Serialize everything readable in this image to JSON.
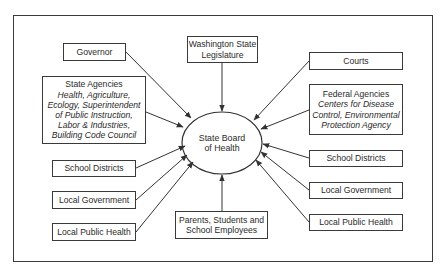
{
  "diagram": {
    "title": "",
    "center": {
      "id": "state-board-of-health",
      "lines": [
        "State Board",
        "of Health"
      ]
    },
    "nodes": [
      {
        "id": "governor",
        "title": "Governor",
        "detail_lines": []
      },
      {
        "id": "state-agencies",
        "title": "State Agencies",
        "detail_lines": [
          "Health, Agriculture,",
          "Ecology, Superintendent",
          "of Public Instruction,",
          "Labor & Industries,",
          "Building Code Council"
        ]
      },
      {
        "id": "school-districts-left",
        "title": "School Districts",
        "detail_lines": []
      },
      {
        "id": "local-government-left",
        "title": "Local Government",
        "detail_lines": []
      },
      {
        "id": "local-public-health-left",
        "title": "Local Public Health",
        "detail_lines": []
      },
      {
        "id": "washington-state-legislature",
        "title_lines": [
          "Washington State",
          "Legislature"
        ],
        "detail_lines": []
      },
      {
        "id": "parents-students-school-employees",
        "title_lines": [
          "Parents, Students and",
          "School Employees"
        ],
        "detail_lines": []
      },
      {
        "id": "courts",
        "title": "Courts",
        "detail_lines": []
      },
      {
        "id": "federal-agencies",
        "title": "Federal Agencies",
        "detail_lines": [
          "Centers for Disease",
          "Control, Environmental",
          "Protection Agency"
        ]
      },
      {
        "id": "school-districts-right",
        "title": "School Districts",
        "detail_lines": []
      },
      {
        "id": "local-government-right",
        "title": "Local Government",
        "detail_lines": []
      },
      {
        "id": "local-public-health-right",
        "title": "Local Public Health",
        "detail_lines": []
      }
    ],
    "edges": [
      {
        "from": "governor",
        "to": "state-board-of-health"
      },
      {
        "from": "state-agencies",
        "to": "state-board-of-health"
      },
      {
        "from": "school-districts-left",
        "to": "state-board-of-health"
      },
      {
        "from": "local-government-left",
        "to": "state-board-of-health"
      },
      {
        "from": "local-public-health-left",
        "to": "state-board-of-health"
      },
      {
        "from": "washington-state-legislature",
        "to": "state-board-of-health"
      },
      {
        "from": "parents-students-school-employees",
        "to": "state-board-of-health"
      },
      {
        "from": "courts",
        "to": "state-board-of-health"
      },
      {
        "from": "federal-agencies",
        "to": "state-board-of-health"
      },
      {
        "from": "school-districts-right",
        "to": "state-board-of-health"
      },
      {
        "from": "local-government-right",
        "to": "state-board-of-health"
      },
      {
        "from": "local-public-health-right",
        "to": "state-board-of-health"
      }
    ],
    "colors": {
      "line": "#333333",
      "text": "#2a2a2a",
      "background": "#ffffff"
    }
  }
}
